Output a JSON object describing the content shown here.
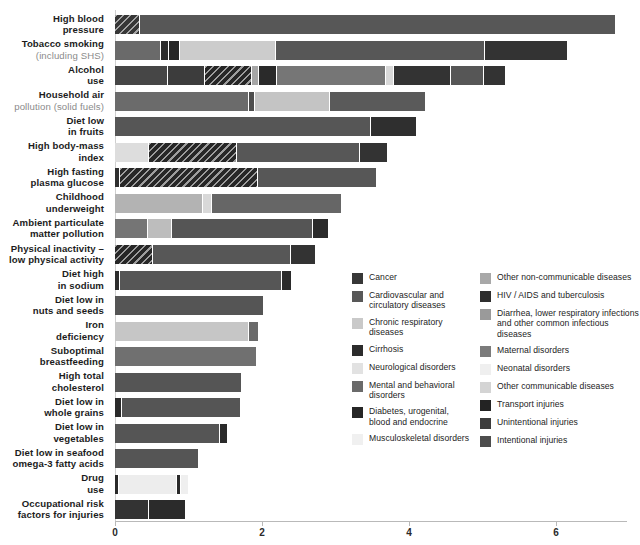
{
  "chart_data": {
    "type": "bar",
    "subtype": "stacked-horizontal",
    "title": "",
    "xlabel": "",
    "ylabel": "",
    "xlim": [
      0,
      7.0
    ],
    "xticks": [
      0,
      2,
      4,
      6
    ],
    "xticklabels": [
      "0",
      "2",
      "4",
      "6"
    ],
    "grid": false,
    "legend_position": "inside-right-bottom",
    "categories": [
      "High blood pressure",
      "Tobacco smoking (including SHS)",
      "Alcohol use",
      "Household air pollution (solid fuels)",
      "Diet low in fruits",
      "High body-mass index",
      "High fasting plasma glucose",
      "Childhood underweight",
      "Ambient particulate matter pollution",
      "Physical inactivity – low physical activity",
      "Diet high in sodium",
      "Diet low in nuts and seeds",
      "Iron deficiency",
      "Suboptimal breastfeeding",
      "High total cholesterol",
      "Diet low in whole grains",
      "Diet low in vegetables",
      "Diet low in seafood omega-3 fatty acids",
      "Drug use",
      "Occupational risk factors for injuries"
    ],
    "totals": [
      6.8,
      6.15,
      5.3,
      4.22,
      4.1,
      3.7,
      3.55,
      3.07,
      2.9,
      2.72,
      2.4,
      2.02,
      1.95,
      1.92,
      1.72,
      1.7,
      1.52,
      1.13,
      1.0,
      0.95
    ],
    "series": [
      {
        "name": "Cancer",
        "color": "#373737"
      },
      {
        "name": "Cardiovascular and circulatory diseases",
        "color": "#585858"
      },
      {
        "name": "Chronic respiratory diseases",
        "color": "#c9c9c9"
      },
      {
        "name": "Cirrhosis",
        "color": "#2c2c2c"
      },
      {
        "name": "Neurological disorders",
        "color": "#e2e2e2"
      },
      {
        "name": "Mental and behavioral disorders",
        "color": "#6a6a6a"
      },
      {
        "name": "Diabetes, urogenital, blood and endocrine",
        "color": "#262626"
      },
      {
        "name": "Musculoskeletal disorders",
        "color": "#f0f0f0"
      },
      {
        "name": "Other non-communicable diseases",
        "color": "#a8a8a8"
      },
      {
        "name": "HIV / AIDS and tuberculosis",
        "color": "#2e2e2e"
      },
      {
        "name": "Diarrhea, lower respiratory infections and other common infectious diseases",
        "color": "#9a9a9a"
      },
      {
        "name": "Maternal disorders",
        "color": "#7b7b7b"
      },
      {
        "name": "Neonatal disorders",
        "color": "#efefef"
      },
      {
        "name": "Other communicable diseases",
        "color": "#d4d4d4"
      },
      {
        "name": "Transport injuries",
        "color": "#232323"
      },
      {
        "name": "Unintentional injuries",
        "color": "#3d3d3d"
      },
      {
        "name": "Intentional injuries",
        "color": "#4d4d4d"
      }
    ]
  },
  "axis": {
    "ticks": [
      {
        "label": "0",
        "value": 0
      },
      {
        "label": "2",
        "value": 2
      },
      {
        "label": "4",
        "value": 4
      },
      {
        "label": "6",
        "value": 6
      }
    ]
  },
  "rows": [
    {
      "label_top": "High blood",
      "label_bottom": "pressure",
      "sub": "",
      "segments": [
        {
          "series": "Cancer",
          "value": 0.34,
          "color": "#373737",
          "hatch": true
        },
        {
          "series": "Cardiovascular and circulatory diseases",
          "value": 6.46,
          "color": "#575757",
          "hatch": false
        }
      ]
    },
    {
      "label_top": "Tobacco smoking",
      "label_bottom": "",
      "sub": "(including SHS)",
      "segments": [
        {
          "series": "Cancer",
          "value": 0.63,
          "color": "#6a6a6a",
          "hatch": false
        },
        {
          "series": "Cirrhosis",
          "value": 0.1,
          "color": "#2c2c2c",
          "hatch": false
        },
        {
          "series": "Diabetes, urogenital, blood and endocrine",
          "value": 0.16,
          "color": "#262626",
          "hatch": false
        },
        {
          "series": "Chronic respiratory diseases",
          "value": 1.3,
          "color": "#cccccc",
          "hatch": false
        },
        {
          "series": "Cardiovascular and circulatory diseases",
          "value": 2.85,
          "color": "#575757",
          "hatch": false
        },
        {
          "series": "Other non-communicable diseases",
          "value": 1.11,
          "color": "#333333",
          "hatch": false
        }
      ]
    },
    {
      "label_top": "Alcohol",
      "label_bottom": "use",
      "sub": "",
      "segments": [
        {
          "series": "Cancer",
          "value": 0.72,
          "color": "#464646",
          "hatch": false
        },
        {
          "series": "Cardiovascular and circulatory diseases",
          "value": 0.5,
          "color": "#3c3c3c",
          "hatch": false
        },
        {
          "series": "Cirrhosis",
          "value": 0.64,
          "color": "#262626",
          "hatch": true
        },
        {
          "series": "Chronic respiratory diseases",
          "value": 0.1,
          "color": "#a6a6a6",
          "hatch": false
        },
        {
          "series": "Diabetes, urogenital, blood and endocrine",
          "value": 0.25,
          "color": "#2a2a2a",
          "hatch": false
        },
        {
          "series": "Mental and behavioral disorders",
          "value": 1.48,
          "color": "#767676",
          "hatch": false
        },
        {
          "series": "Musculoskeletal disorders",
          "value": 0.1,
          "color": "#d8d8d8",
          "hatch": false
        },
        {
          "series": "Transport injuries",
          "value": 0.78,
          "color": "#333333",
          "hatch": false
        },
        {
          "series": "Unintentional injuries",
          "value": 0.45,
          "color": "#565656",
          "hatch": false
        },
        {
          "series": "Intentional injuries",
          "value": 0.28,
          "color": "#333333",
          "hatch": false
        }
      ]
    },
    {
      "label_top": "Household air",
      "label_bottom": "",
      "sub": "pollution (solid fuels)",
      "segments": [
        {
          "series": "Chronic respiratory diseases",
          "value": 1.82,
          "color": "#6b6b6b",
          "hatch": false
        },
        {
          "series": "Cardiovascular and circulatory diseases",
          "value": 0.08,
          "color": "#4e4e4e",
          "hatch": false
        },
        {
          "series": "Other non-communicable diseases",
          "value": 1.02,
          "color": "#c4c4c4",
          "hatch": false
        },
        {
          "series": "Diarrhea, lower respiratory infections",
          "value": 1.3,
          "color": "#5a5a5a",
          "hatch": false
        }
      ]
    },
    {
      "label_top": "Diet low",
      "label_bottom": "in fruits",
      "sub": "",
      "segments": [
        {
          "series": "Cardiovascular and circulatory diseases",
          "value": 3.48,
          "color": "#565656",
          "hatch": false
        },
        {
          "series": "Cancer",
          "value": 0.62,
          "color": "#2f2f2f",
          "hatch": false
        }
      ]
    },
    {
      "label_top": "High body-mass",
      "label_bottom": "index",
      "sub": "",
      "segments": [
        {
          "series": "Musculoskeletal disorders",
          "value": 0.46,
          "color": "#dddddd",
          "hatch": false
        },
        {
          "series": "Diabetes, urogenital, blood and endocrine",
          "value": 1.2,
          "color": "#272727",
          "hatch": true
        },
        {
          "series": "Cardiovascular and circulatory diseases",
          "value": 1.68,
          "color": "#575757",
          "hatch": false
        },
        {
          "series": "Cancer",
          "value": 0.36,
          "color": "#333333",
          "hatch": false
        }
      ]
    },
    {
      "label_top": "High fasting",
      "label_bottom": "plasma glucose",
      "sub": "",
      "segments": [
        {
          "series": "Cancer",
          "value": 0.07,
          "color": "#2f2f2f",
          "hatch": false
        },
        {
          "series": "Diabetes, urogenital, blood and endocrine",
          "value": 1.88,
          "color": "#272727",
          "hatch": true
        },
        {
          "series": "Cardiovascular and circulatory diseases",
          "value": 1.6,
          "color": "#575757",
          "hatch": false
        }
      ]
    },
    {
      "label_top": "Childhood",
      "label_bottom": "underweight",
      "sub": "",
      "segments": [
        {
          "series": "Diarrhea, lower respiratory infections",
          "value": 1.2,
          "color": "#b3b3b3",
          "hatch": false
        },
        {
          "series": "Other communicable diseases",
          "value": 0.12,
          "color": "#d8d8d8",
          "hatch": false
        },
        {
          "series": "Maternal disorders",
          "value": 1.75,
          "color": "#666666",
          "hatch": false
        }
      ]
    },
    {
      "label_top": "Ambient particulate",
      "label_bottom": "matter pollution",
      "sub": "",
      "segments": [
        {
          "series": "Chronic respiratory diseases",
          "value": 0.45,
          "color": "#757575",
          "hatch": false
        },
        {
          "series": "Other non-communicable diseases",
          "value": 0.32,
          "color": "#bdbdbd",
          "hatch": false
        },
        {
          "series": "Cardiovascular and circulatory diseases",
          "value": 1.93,
          "color": "#555555",
          "hatch": false
        },
        {
          "series": "Cancer",
          "value": 0.2,
          "color": "#2b2b2b",
          "hatch": false
        }
      ]
    },
    {
      "label_top": "Physical inactivity –",
      "label_bottom": "low physical activity",
      "sub": "",
      "segments": [
        {
          "series": "Diabetes, urogenital, blood and endocrine",
          "value": 0.52,
          "color": "#272727",
          "hatch": true
        },
        {
          "series": "Cardiovascular and circulatory diseases",
          "value": 1.88,
          "color": "#575757",
          "hatch": false
        },
        {
          "series": "Cancer",
          "value": 0.32,
          "color": "#333333",
          "hatch": false
        }
      ]
    },
    {
      "label_top": "Diet high",
      "label_bottom": "in sodium",
      "sub": "",
      "segments": [
        {
          "series": "Cancer",
          "value": 0.07,
          "color": "#2d2d2d",
          "hatch": false
        },
        {
          "series": "Cardiovascular and circulatory diseases",
          "value": 2.2,
          "color": "#565656",
          "hatch": false
        },
        {
          "series": "Other non-communicable diseases",
          "value": 0.13,
          "color": "#2b2b2b",
          "hatch": false
        }
      ]
    },
    {
      "label_top": "Diet low in",
      "label_bottom": "nuts and seeds",
      "sub": "",
      "segments": [
        {
          "series": "Cardiovascular and circulatory diseases",
          "value": 2.02,
          "color": "#555555",
          "hatch": false
        }
      ]
    },
    {
      "label_top": "Iron",
      "label_bottom": "deficiency",
      "sub": "",
      "segments": [
        {
          "series": "Other non-communicable diseases",
          "value": 1.82,
          "color": "#c6c6c6",
          "hatch": false
        },
        {
          "series": "Maternal disorders",
          "value": 0.13,
          "color": "#6a6a6a",
          "hatch": false
        }
      ]
    },
    {
      "label_top": "Suboptimal",
      "label_bottom": "breastfeeding",
      "sub": "",
      "segments": [
        {
          "series": "Diarrhea, lower respiratory infections",
          "value": 1.92,
          "color": "#707070",
          "hatch": false
        }
      ]
    },
    {
      "label_top": "High total",
      "label_bottom": "cholesterol",
      "sub": "",
      "segments": [
        {
          "series": "Cardiovascular and circulatory diseases",
          "value": 1.72,
          "color": "#555555",
          "hatch": false
        }
      ]
    },
    {
      "label_top": "Diet low in",
      "label_bottom": "whole grains",
      "sub": "",
      "segments": [
        {
          "series": "Cancer",
          "value": 0.1,
          "color": "#2a2a2a",
          "hatch": false
        },
        {
          "series": "Cardiovascular and circulatory diseases",
          "value": 1.6,
          "color": "#555555",
          "hatch": false
        }
      ]
    },
    {
      "label_top": "Diet low in",
      "label_bottom": "vegetables",
      "sub": "",
      "segments": [
        {
          "series": "Cardiovascular and circulatory diseases",
          "value": 1.43,
          "color": "#555555",
          "hatch": false
        },
        {
          "series": "Cancer",
          "value": 0.09,
          "color": "#2a2a2a",
          "hatch": false
        }
      ]
    },
    {
      "label_top": "Diet low in seafood",
      "label_bottom": "omega-3 fatty acids",
      "sub": "",
      "segments": [
        {
          "series": "Cardiovascular and circulatory diseases",
          "value": 1.13,
          "color": "#555555",
          "hatch": false
        }
      ]
    },
    {
      "label_top": "Drug",
      "label_bottom": "use",
      "sub": "",
      "segments": [
        {
          "series": "Cirrhosis",
          "value": 0.05,
          "color": "#2a2a2a",
          "hatch": false
        },
        {
          "series": "HIV / AIDS and tuberculosis",
          "value": 0.8,
          "color": "#ededed",
          "hatch": false
        },
        {
          "series": "Unintentional injuries",
          "value": 0.05,
          "color": "#2a2a2a",
          "hatch": false
        },
        {
          "series": "Mental and behavioral disorders",
          "value": 0.1,
          "color": "#efefef",
          "hatch": false
        }
      ]
    },
    {
      "label_top": "Occupational risk",
      "label_bottom": "factors for injuries",
      "sub": "",
      "segments": [
        {
          "series": "Transport injuries",
          "value": 0.46,
          "color": "#333333",
          "hatch": false
        },
        {
          "series": "Unintentional injuries",
          "value": 0.49,
          "color": "#2b2b2b",
          "hatch": false
        }
      ]
    }
  ],
  "legend": {
    "column1": [
      {
        "label": "Cancer",
        "color": "#373737"
      },
      {
        "label": "Cardiovascular and circulatory diseases",
        "color": "#585858"
      },
      {
        "label": "Chronic respiratory diseases",
        "color": "#c9c9c9"
      },
      {
        "label": "Cirrhosis",
        "color": "#2c2c2c"
      },
      {
        "label": "Neurological disorders",
        "color": "#e2e2e2"
      },
      {
        "label": "Mental and behavioral disorders",
        "color": "#6a6a6a"
      },
      {
        "label": "Diabetes, urogenital, blood and endocrine",
        "color": "#262626"
      },
      {
        "label": "Musculoskeletal disorders",
        "color": "#f0f0f0"
      }
    ],
    "column2": [
      {
        "label": "Other non-communicable diseases",
        "color": "#a8a8a8"
      },
      {
        "label": "HIV / AIDS and tuberculosis",
        "color": "#2e2e2e"
      },
      {
        "label": "Diarrhea, lower respiratory infections and other common infectious diseases",
        "color": "#9a9a9a"
      },
      {
        "label": "Maternal disorders",
        "color": "#7b7b7b"
      },
      {
        "label": "Neonatal disorders",
        "color": "#efefef"
      },
      {
        "label": "Other communicable diseases",
        "color": "#d4d4d4"
      },
      {
        "label": "Transport injuries",
        "color": "#232323"
      },
      {
        "label": "Unintentional injuries",
        "color": "#3d3d3d"
      },
      {
        "label": "Intentional injuries",
        "color": "#4d4d4d"
      }
    ]
  }
}
